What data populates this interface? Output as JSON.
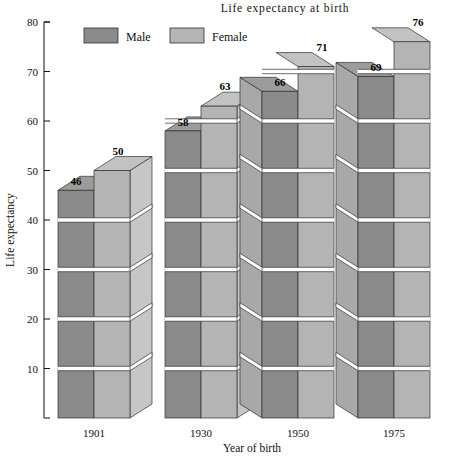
{
  "chart_data": {
    "type": "bar",
    "title": "Life expectancy at birth",
    "xlabel": "Year of birth",
    "ylabel": "Life expectancy",
    "categories": [
      "1901",
      "1930",
      "1950",
      "1975"
    ],
    "series": [
      {
        "name": "Male",
        "values": [
          46,
          58,
          66,
          69
        ],
        "color": "#8a8a8a"
      },
      {
        "name": "Female",
        "values": [
          50,
          63,
          71,
          76
        ],
        "color": "#b4b4b4"
      }
    ],
    "ylim": [
      0,
      80
    ],
    "yticks": [
      0,
      10,
      20,
      30,
      40,
      50,
      60,
      70,
      80
    ],
    "ytick_labels": [
      "",
      "10",
      "20",
      "30",
      "40",
      "50",
      "60",
      "70",
      "80"
    ],
    "grid": false,
    "legend_position": "top-left",
    "style": "3d-stacked-blocks",
    "block_unit": 10,
    "data_labels": [
      "46",
      "50",
      "58",
      "63",
      "66",
      "71",
      "69",
      "76"
    ]
  },
  "legend": {
    "items": [
      {
        "label": "Male",
        "swatch": "#8a8a8a"
      },
      {
        "label": "Female",
        "swatch": "#b4b4b4"
      }
    ]
  },
  "axes": {
    "y_title": "Life expectancy",
    "x_title": "Year of birth",
    "y_ticks": [
      "80",
      "70",
      "60",
      "50",
      "40",
      "30",
      "20",
      "10"
    ],
    "x_ticks": [
      "1901",
      "1930",
      "1950",
      "1975"
    ]
  },
  "title": "Life expectancy at birth",
  "colors": {
    "male_face": "#8a8a8a",
    "female_face": "#b4b4b4",
    "male_side": "#a8a8a8",
    "female_side": "#c6c6c6",
    "male_top": "#9c9c9c",
    "female_top": "#c2c2c2",
    "outline": "#303030",
    "background": "#ffffff",
    "axis": "#111111"
  }
}
